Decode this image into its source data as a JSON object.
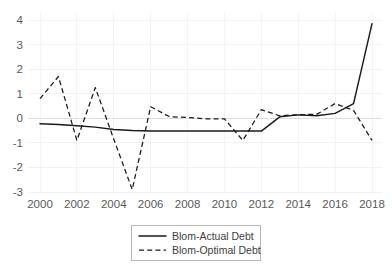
{
  "chart_data": {
    "type": "line",
    "title": "",
    "xlabel": "",
    "ylabel": "",
    "x": [
      2000,
      2001,
      2002,
      2003,
      2004,
      2005,
      2006,
      2007,
      2008,
      2009,
      2010,
      2011,
      2012,
      2013,
      2014,
      2015,
      2016,
      2017,
      2018
    ],
    "xlim": [
      2000,
      2018
    ],
    "ylim": [
      -3,
      4
    ],
    "ytick_labels": [
      "4",
      "3",
      "2",
      "1",
      "0",
      "-1",
      "-2",
      "-3"
    ],
    "ytick_values": [
      4,
      3,
      2,
      1,
      0,
      -1,
      -2,
      -3
    ],
    "xtick_labels": [
      "2000",
      "2002",
      "2004",
      "2006",
      "2008",
      "2010",
      "2012",
      "2014",
      "2016",
      "2018"
    ],
    "xtick_values": [
      2000,
      2002,
      2004,
      2006,
      2008,
      2010,
      2012,
      2014,
      2016,
      2018
    ],
    "grid": true,
    "legend_position": "bottom-center",
    "series": [
      {
        "name": "Blom-Actual Debt",
        "style": "solid",
        "color": "#1a1a1a",
        "values": [
          -0.22,
          -0.25,
          -0.3,
          -0.36,
          -0.46,
          -0.5,
          -0.52,
          -0.52,
          -0.52,
          -0.52,
          -0.52,
          -0.52,
          -0.52,
          0.06,
          0.14,
          0.1,
          0.2,
          0.6,
          3.85
        ]
      },
      {
        "name": "Blom-Optimal Debt",
        "style": "dashed",
        "color": "#1a1a1a",
        "values": [
          0.8,
          1.7,
          -0.9,
          1.25,
          -0.85,
          -2.9,
          0.47,
          0.07,
          0.03,
          -0.02,
          -0.02,
          -0.9,
          0.35,
          0.1,
          0.15,
          0.16,
          0.6,
          0.32,
          -0.9
        ]
      }
    ]
  },
  "legend": {
    "items": [
      {
        "label": "Blom-Actual Debt",
        "style": "solid"
      },
      {
        "label": "Blom-Optimal Debt",
        "style": "dashed"
      }
    ]
  }
}
